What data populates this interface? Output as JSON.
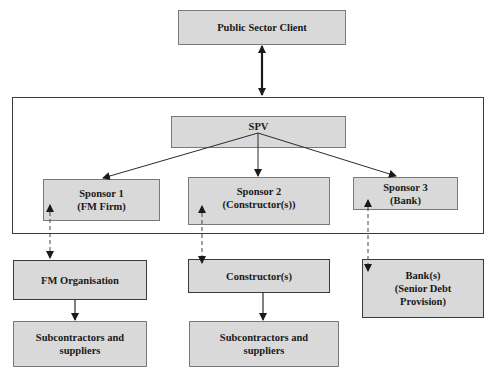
{
  "diagram": {
    "title": "",
    "nodes": {
      "public_sector_client": {
        "label": "Public Sector Client"
      },
      "spv": {
        "label": "SPV"
      },
      "sponsor1": {
        "line1": "Sponsor 1",
        "line2": "(FM Firm)"
      },
      "sponsor2": {
        "line1": "Sponsor 2",
        "line2": "(Constructor(s))"
      },
      "sponsor3": {
        "line1": "Sponsor 3",
        "line2": "(Bank)"
      },
      "fm_organisation": {
        "label": "FM Organisation"
      },
      "constructors": {
        "label": "Constructor(s)"
      },
      "banks": {
        "line1": "Bank(s)",
        "line2": "(Senior Debt",
        "line3": "Provision)"
      },
      "subcontractors_fm": {
        "line1": "Subcontractors and",
        "line2": "suppliers"
      },
      "subcontractors_constructor": {
        "line1": "Subcontractors and",
        "line2": "suppliers"
      }
    },
    "edges": [
      {
        "from": "public_sector_client",
        "to": "spv_container",
        "style": "solid",
        "direction": "both"
      },
      {
        "from": "spv",
        "to": "sponsor1",
        "style": "solid",
        "direction": "forward"
      },
      {
        "from": "spv",
        "to": "sponsor2",
        "style": "solid",
        "direction": "forward"
      },
      {
        "from": "spv",
        "to": "sponsor3",
        "style": "solid",
        "direction": "forward"
      },
      {
        "from": "sponsor1",
        "to": "fm_organisation",
        "style": "dashed",
        "direction": "both"
      },
      {
        "from": "sponsor2",
        "to": "constructors",
        "style": "dashed",
        "direction": "both"
      },
      {
        "from": "sponsor3",
        "to": "banks",
        "style": "dashed",
        "direction": "both"
      },
      {
        "from": "fm_organisation",
        "to": "subcontractors_fm",
        "style": "solid",
        "direction": "forward"
      },
      {
        "from": "constructors",
        "to": "subcontractors_constructor",
        "style": "solid",
        "direction": "forward"
      }
    ],
    "colors": {
      "box_fill": "#d9d9d9",
      "box_border": "#7a7a7a",
      "dark_border": "#3a3a3a",
      "line": "#2a2a2a",
      "text": "#1a1a1a"
    }
  }
}
